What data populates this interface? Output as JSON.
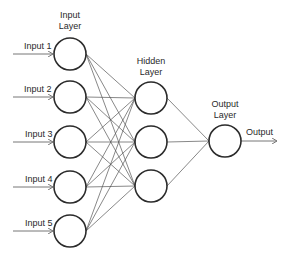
{
  "diagram": {
    "layers": [
      {
        "label_line1": "Input",
        "label_line2": "Layer"
      },
      {
        "label_line1": "Hidden",
        "label_line2": "Layer"
      },
      {
        "label_line1": "Output",
        "label_line2": "Layer"
      }
    ],
    "inputs": [
      "Input 1",
      "Input 2",
      "Input 3",
      "Input 4",
      "Input 5"
    ],
    "hidden_count": 3,
    "output_count": 1,
    "output_label": "Output",
    "colors": {
      "stroke": "#2b2b2b",
      "edge": "#555555",
      "background": "#ffffff"
    }
  }
}
